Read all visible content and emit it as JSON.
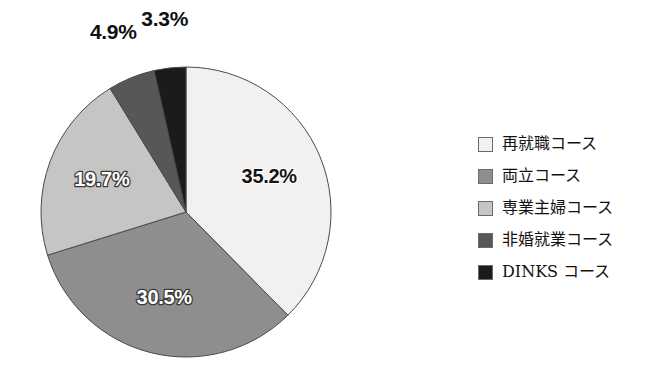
{
  "chart_data": {
    "type": "pie",
    "title": "",
    "subtitle": "",
    "xlabel": "",
    "ylabel": "",
    "grid": false,
    "legend_position": "right",
    "start_angle_deg": 0,
    "direction": "clockwise",
    "unit": "%",
    "categories": [
      "再就職コース",
      "両立コース",
      "専業主婦コース",
      "非婚就業コース",
      "DINKS コース"
    ],
    "values": [
      35.2,
      30.5,
      19.7,
      4.9,
      3.3
    ],
    "value_labels": [
      "35.2%",
      "30.5%",
      "19.7%",
      "4.9%",
      "3.3%"
    ],
    "colors": [
      "#f2f1ef",
      "#8e8e8e",
      "#c6c5c3",
      "#575757",
      "#1b1b1b"
    ],
    "slices": [
      {
        "label": "再就職コース",
        "value": 35.2,
        "value_label": "35.2%",
        "color": "#f2f1ef",
        "label_placement": "inside"
      },
      {
        "label": "両立コース",
        "value": 30.5,
        "value_label": "30.5%",
        "color": "#8e8e8e",
        "label_placement": "inside"
      },
      {
        "label": "専業主婦コース",
        "value": 19.7,
        "value_label": "19.7%",
        "color": "#c6c5c3",
        "label_placement": "inside"
      },
      {
        "label": "非婚就業コース",
        "value": 4.9,
        "value_label": "4.9%",
        "color": "#575757",
        "label_placement": "outside"
      },
      {
        "label": "DINKS コース",
        "value": 3.3,
        "value_label": "3.3%",
        "color": "#1b1b1b",
        "label_placement": "outside"
      }
    ]
  },
  "legend": {
    "items": [
      {
        "label": "再就職コース",
        "color": "#f2f1ef"
      },
      {
        "label": "両立コース",
        "color": "#8e8e8e"
      },
      {
        "label": "専業主婦コース",
        "color": "#c6c5c3"
      },
      {
        "label": "非婚就業コース",
        "color": "#575757"
      },
      {
        "label": "DINKS コース",
        "color": "#1b1b1b"
      }
    ]
  }
}
